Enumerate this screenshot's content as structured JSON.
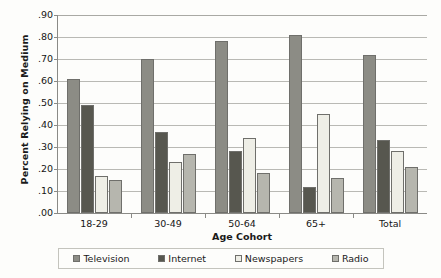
{
  "chart_data": {
    "type": "bar",
    "title": "",
    "xlabel": "Age Cohort",
    "ylabel": "Percent Relying on Medium",
    "categories": [
      "18-29",
      "30-49",
      "50-64",
      "65+",
      "Total"
    ],
    "series": [
      {
        "name": "Television",
        "values": [
          0.61,
          0.7,
          0.78,
          0.81,
          0.72
        ],
        "color": "#8c8c85"
      },
      {
        "name": "Internet",
        "values": [
          0.49,
          0.37,
          0.28,
          0.12,
          0.33
        ],
        "color": "#57574f"
      },
      {
        "name": "Newspapers",
        "values": [
          0.17,
          0.23,
          0.34,
          0.45,
          0.28
        ],
        "color": "#eeeee6"
      },
      {
        "name": "Radio",
        "values": [
          0.15,
          0.27,
          0.18,
          0.16,
          0.21
        ],
        "color": "#b6b6ae"
      }
    ],
    "ylim": [
      0.0,
      0.9
    ],
    "ytick_values": [
      0.0,
      0.1,
      0.2,
      0.3,
      0.4,
      0.5,
      0.6,
      0.7,
      0.8,
      0.9
    ],
    "ytick_labels": [
      ".00",
      ".10",
      ".20",
      ".30",
      ".40",
      ".50",
      ".60",
      ".70",
      ".80",
      ".90"
    ],
    "grid": "horizontal",
    "legend_position": "bottom"
  }
}
